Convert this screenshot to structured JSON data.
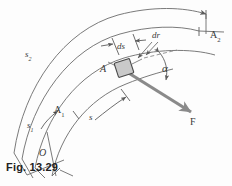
{
  "figure": {
    "caption": "Fig. 13.29",
    "origin_label": "O",
    "colors": {
      "curve_stroke": "#6b6b6b",
      "force_arrow": "#8a8a8a",
      "block_fill": "#c9c9c9",
      "block_stroke": "#4a4a4a",
      "label_text": "#3a3a3a",
      "caption_text": "#222222",
      "background": "#fdfdfd"
    },
    "labels": {
      "point_A": "A",
      "point_A1_main": "A",
      "point_A1_sub": "1",
      "point_A2_main": "A",
      "point_A2_sub": "2",
      "arc_s_main": "s",
      "arc_s1_main": "s",
      "arc_s1_sub": "1",
      "arc_s2_main": "s",
      "arc_s2_sub": "2",
      "differential_ds": "ds",
      "differential_dr": "dr",
      "angle_alpha": "α",
      "force_F": "F"
    },
    "elements": {
      "inner_arc_name": "inner path arc",
      "outer_arc_name": "outer measurement arc",
      "middle_arc_name": "particle path arc",
      "force_vector_name": "force vector F",
      "block_name": "particle block at A",
      "angle_arc_name": "angle alpha arc"
    }
  }
}
